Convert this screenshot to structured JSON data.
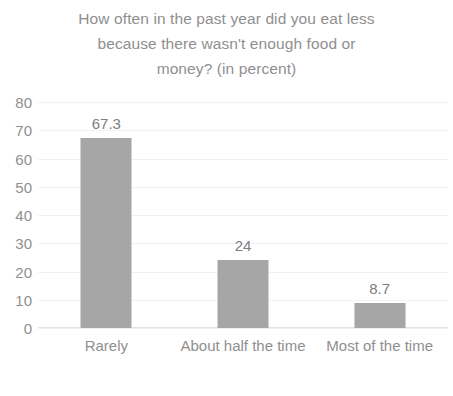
{
  "chart_data": {
    "type": "bar",
    "title": "How often in the past year did you eat less\nbecause there wasn't enough food or\nmoney? (in percent)",
    "categories": [
      "Rarely",
      "About half the time",
      "Most of the time"
    ],
    "values": [
      67.3,
      24,
      8.7
    ],
    "value_labels": [
      "67.3",
      "24",
      "8.7"
    ],
    "xlabel": "",
    "ylabel": "",
    "ylim": [
      0,
      80
    ],
    "ytick_labels": [
      "80",
      "70",
      "60",
      "50",
      "40",
      "30",
      "20",
      "10",
      "0"
    ],
    "ytick_values": [
      80,
      70,
      60,
      50,
      40,
      30,
      20,
      10,
      0
    ],
    "grid": true,
    "legend": "none",
    "bar_color": "#a6a6a6",
    "text_color": "#8f8f8f",
    "gridline_color": "#f1f1f1",
    "background_color": "#ffffff"
  }
}
